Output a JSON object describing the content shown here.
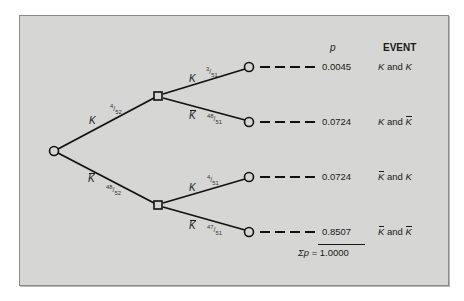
{
  "diagram": {
    "type": "probability-tree",
    "headers": {
      "p": "p",
      "event": "EVENT"
    },
    "root": {
      "label": "start"
    },
    "first_stage": [
      {
        "branch": "K",
        "prob": "4/52"
      },
      {
        "branch": "K̄",
        "prob": "48/52"
      }
    ],
    "second_stage": [
      {
        "parent": "K",
        "branch": "K",
        "prob": "3/51"
      },
      {
        "parent": "K",
        "branch": "K̄",
        "prob": "48/51"
      },
      {
        "parent": "K̄",
        "branch": "K",
        "prob": "4/51"
      },
      {
        "parent": "K̄",
        "branch": "K̄",
        "prob": "47/51"
      }
    ],
    "outcomes": [
      {
        "p": "0.0045",
        "event_a": "K",
        "and": "and",
        "event_b": "K"
      },
      {
        "p": "0.0724",
        "event_a": "K",
        "and": "and",
        "event_b": "K̄"
      },
      {
        "p": "0.0724",
        "event_a": "K̄",
        "and": "and",
        "event_b": "K"
      },
      {
        "p": "0.8507",
        "event_a": "K̄",
        "and": "and",
        "event_b": "K̄"
      }
    ],
    "sum": {
      "label": "Σp",
      "equals": "=",
      "value": "1.0000"
    },
    "labels": {
      "k": "K",
      "kbar_base": "K",
      "f_4_52": {
        "num": "4",
        "den": "52"
      },
      "f_48_52": {
        "num": "48",
        "den": "52"
      },
      "f_3_51": {
        "num": "3",
        "den": "51"
      },
      "f_48_51": {
        "num": "48",
        "den": "51"
      },
      "f_4_51": {
        "num": "4",
        "den": "51"
      },
      "f_47_51": {
        "num": "47",
        "den": "51"
      }
    }
  }
}
